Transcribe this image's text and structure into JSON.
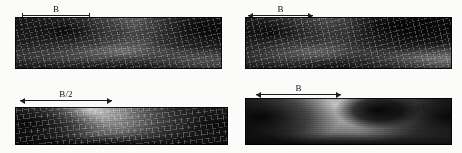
{
  "figure": {
    "title": "",
    "background_color": "#fbfbfa",
    "annotation_color": "#1c1c1c",
    "rows": 2,
    "columns": 2
  },
  "panels": [
    {
      "id": "a",
      "label": "(a)",
      "dimension_label": "B",
      "dimension_style": "bracket-ticks",
      "surface_type": "wireframe-shaded",
      "description": "3D shaded surface with wireframe mesh, deep trough",
      "x": 15,
      "y": 17,
      "width": 207,
      "height": 52,
      "dim_x": 22,
      "dim_y": 3,
      "dim_w": 68,
      "label_x": 203,
      "label_y": 21,
      "colors": {
        "shadow": "#0a0a0a",
        "mid": "#6b6b6b",
        "highlight": "#c9c9c9"
      }
    },
    {
      "id": "b",
      "label": "(b)",
      "dimension_label": "B",
      "dimension_style": "double-arrow",
      "surface_type": "wireframe-shaded",
      "description": "3D shaded surface with wireframe mesh, narrower crest",
      "x": 245,
      "y": 17,
      "width": 207,
      "height": 52,
      "dim_x": 248,
      "dim_y": 3,
      "dim_w": 65,
      "label_x": 432,
      "label_y": 21,
      "colors": {
        "shadow": "#0a0a0a",
        "mid": "#6b6b6b",
        "highlight": "#c9c9c9"
      }
    },
    {
      "id": "c",
      "label": "(c)",
      "dimension_label": "B/2",
      "dimension_style": "double-arrow",
      "surface_type": "wireframe-shaded",
      "description": "3D shaded surface with wireframe mesh, shallow wide basin",
      "x": 15,
      "y": 107,
      "width": 213,
      "height": 38,
      "dim_x": 20,
      "dim_y": 88,
      "dim_w": 92,
      "label_x": 206,
      "label_y": 112,
      "colors": {
        "shadow": "#0a0a0a",
        "mid": "#6b6b6b",
        "highlight": "#c9c9c9"
      }
    },
    {
      "id": "d",
      "label": "(d)",
      "dimension_label": "B",
      "dimension_style": "double-arrow",
      "surface_type": "smooth-shaded",
      "description": "3D smooth shaded surface without mesh lines",
      "x": 245,
      "y": 98,
      "width": 207,
      "height": 47,
      "dim_x": 256,
      "dim_y": 82,
      "dim_w": 85,
      "label_x": 417,
      "label_y": 102,
      "colors": {
        "shadow": "#0a0a0a",
        "mid": "#787878",
        "highlight": "#b5b5b5"
      }
    }
  ]
}
